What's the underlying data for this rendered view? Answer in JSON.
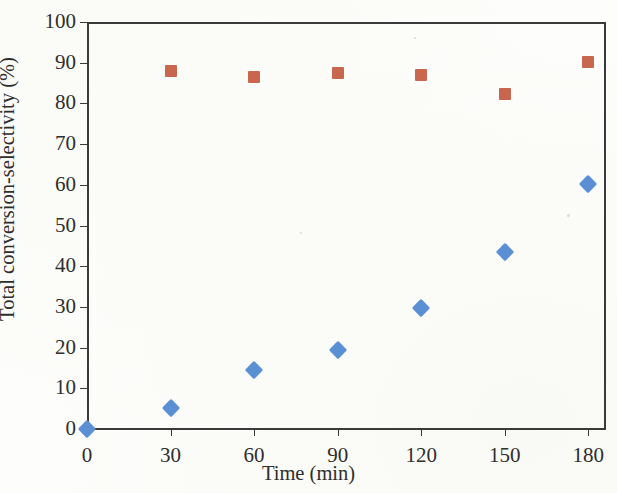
{
  "chart_data": {
    "type": "scatter",
    "title": "",
    "xlabel": "Time (min)",
    "ylabel": "Total conversion-selectivity (%)",
    "xlim": [
      0,
      186
    ],
    "ylim": [
      0,
      100
    ],
    "xticks": [
      0,
      30,
      60,
      90,
      120,
      150,
      180
    ],
    "xtick_labels": [
      "0",
      "30",
      "60",
      "90",
      "120",
      "150",
      "180"
    ],
    "yticks": [
      0,
      10,
      20,
      30,
      40,
      50,
      60,
      70,
      80,
      90,
      100
    ],
    "ytick_labels": [
      "0",
      "10",
      "20",
      "30",
      "40",
      "50",
      "60",
      "70",
      "80",
      "90",
      "100"
    ],
    "grid": false,
    "legend": "none",
    "x": [
      0,
      30,
      60,
      90,
      120,
      150,
      180
    ],
    "series": [
      {
        "name": "Total conversion",
        "marker": "diamond",
        "color": "#5b8fd4",
        "x": [
          0,
          30,
          60,
          90,
          120,
          150,
          180
        ],
        "values": [
          0,
          5.1,
          14.4,
          19.4,
          29.7,
          43.5,
          60.2
        ]
      },
      {
        "name": "Selectivity",
        "marker": "square",
        "color": "#c8674e",
        "x": [
          30,
          60,
          90,
          120,
          150,
          180
        ],
        "values": [
          88.0,
          86.6,
          87.5,
          87.1,
          82.4,
          90.1
        ]
      }
    ]
  },
  "axes": {
    "y_title": "Total conversion-selectivity (%)",
    "x_title": "Time (min)"
  }
}
